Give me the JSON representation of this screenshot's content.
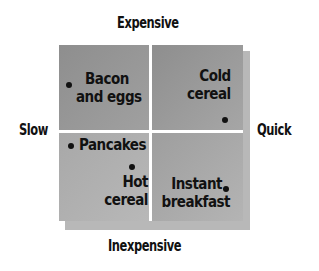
{
  "axes": {
    "top": "Expensive",
    "bottom": "Inexpensive",
    "left": "Slow",
    "right": "Quick"
  },
  "items": [
    {
      "line1": "Bacon",
      "line2": "and eggs",
      "quadrant": "expensive-slow"
    },
    {
      "line1": "Cold",
      "line2": "cereal",
      "quadrant": "expensive-quick"
    },
    {
      "line1": "Pancakes",
      "line2": "",
      "quadrant": "inexpensive-slow"
    },
    {
      "line1": "Hot",
      "line2": "cereal",
      "quadrant": "inexpensive-slow"
    },
    {
      "line1": "Instant",
      "line2": "breakfast",
      "quadrant": "inexpensive-quick"
    }
  ]
}
